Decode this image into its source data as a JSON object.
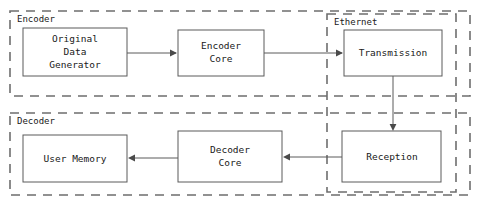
{
  "diagram": {
    "groups": [
      {
        "id": "encoder",
        "label": "Encoder",
        "x": 10,
        "y": 11,
        "w": 460,
        "h": 85,
        "style": "dashed"
      },
      {
        "id": "ethernet",
        "label": "Ethernet",
        "x": 327,
        "y": 14,
        "w": 129,
        "h": 178,
        "style": "dashed"
      },
      {
        "id": "decoder",
        "label": "Decoder",
        "x": 10,
        "y": 113,
        "w": 460,
        "h": 82,
        "style": "dashed"
      }
    ],
    "blocks": [
      {
        "id": "original-data-generator",
        "label": "Original Data Generator",
        "lines": [
          "Original",
          "Data",
          "Generator"
        ],
        "x": 23,
        "y": 28,
        "w": 104,
        "h": 48,
        "group": "encoder"
      },
      {
        "id": "encoder-core",
        "label": "Encoder Core",
        "lines": [
          "Encoder",
          "Core"
        ],
        "x": 178,
        "y": 30,
        "w": 86,
        "h": 46,
        "group": "encoder"
      },
      {
        "id": "transmission",
        "label": "Transmission",
        "lines": [
          "Transmission"
        ],
        "x": 344,
        "y": 30,
        "w": 98,
        "h": 46,
        "group": "ethernet"
      },
      {
        "id": "reception",
        "label": "Reception",
        "lines": [
          "Reception"
        ],
        "x": 342,
        "y": 131,
        "w": 99,
        "h": 51,
        "group": "ethernet"
      },
      {
        "id": "decoder-core",
        "label": "Decoder Core",
        "lines": [
          "Decoder",
          "Core"
        ],
        "x": 178,
        "y": 131,
        "w": 104,
        "h": 51,
        "group": "decoder"
      },
      {
        "id": "user-memory",
        "label": "User Memory",
        "lines": [
          "User Memory"
        ],
        "x": 23,
        "y": 135,
        "w": 104,
        "h": 47,
        "group": "decoder"
      }
    ],
    "connections": [
      {
        "id": "gen-to-encoder-core",
        "from": "original-data-generator",
        "to": "encoder-core",
        "label": "",
        "path": "M127,53 L176,53",
        "arrow": "right",
        "head_x": 177,
        "head_y": 53
      },
      {
        "id": "encoder-core-to-transmission",
        "from": "encoder-core",
        "to": "transmission",
        "label": "",
        "path": "M264,53 L342,53",
        "arrow": "right",
        "head_x": 343,
        "head_y": 53
      },
      {
        "id": "transmission-to-reception",
        "from": "transmission",
        "to": "reception",
        "label": "",
        "path": "M393,76 L393,129",
        "arrow": "down",
        "head_x": 393,
        "head_y": 130
      },
      {
        "id": "reception-to-decoder-core",
        "from": "reception",
        "to": "decoder-core",
        "label": "",
        "path": "M342,157 L284,157",
        "arrow": "left",
        "head_x": 283,
        "head_y": 157
      },
      {
        "id": "decoder-core-to-user-memory",
        "from": "decoder-core",
        "to": "user-memory",
        "label": "",
        "path": "M178,158 L129,158",
        "arrow": "left",
        "head_x": 128,
        "head_y": 158
      }
    ],
    "colors": {
      "background": "#ffffff",
      "group_border": "#6e6e6e",
      "block_border": "#5a5a5a",
      "block_fill": "#ffffff",
      "text": "#202020",
      "arrow": "#4a4a4a"
    }
  }
}
